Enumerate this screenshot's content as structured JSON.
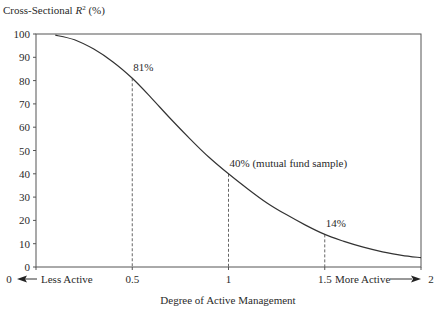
{
  "chart_data": {
    "type": "line",
    "title": "",
    "ylabel": "Cross-Sectional R² (%)",
    "ylabel_parts": {
      "prefix": "Cross-Sectional ",
      "var": "R",
      "sup": "2",
      "suffix": " (%)"
    },
    "xlabel": "Degree of Active Management",
    "xlim": [
      0,
      2
    ],
    "ylim": [
      0,
      100
    ],
    "grid": false,
    "legend": null,
    "yticks": [
      0,
      10,
      20,
      30,
      40,
      50,
      60,
      70,
      80,
      90,
      100
    ],
    "xticks": [
      {
        "value": 0,
        "label": "0"
      },
      {
        "value": 0.5,
        "label": "0.5"
      },
      {
        "value": 1,
        "label": "1"
      },
      {
        "value": 1.5,
        "label": "1.5"
      },
      {
        "value": 2,
        "label": "2"
      }
    ],
    "x_annotations": {
      "left": "Less Active",
      "right": "More Active"
    },
    "series": [
      {
        "name": "Cross-Sectional R²",
        "x": [
          0.1,
          0.2,
          0.3,
          0.4,
          0.5,
          0.6,
          0.7,
          0.8,
          0.9,
          1.0,
          1.1,
          1.2,
          1.3,
          1.4,
          1.5,
          1.6,
          1.7,
          1.8,
          1.9,
          2.0
        ],
        "y": [
          99.5,
          97.5,
          93.5,
          88,
          81,
          72.5,
          63.5,
          55,
          47,
          40,
          33.5,
          27.5,
          22.5,
          18,
          14,
          11,
          8.5,
          6.5,
          5,
          4
        ]
      }
    ],
    "annotations": [
      {
        "x": 0.5,
        "y": 81,
        "label": "81%"
      },
      {
        "x": 1.0,
        "y": 40,
        "label": "40% (mutual fund sample)"
      },
      {
        "x": 1.5,
        "y": 14,
        "label": "14%"
      }
    ]
  },
  "colors": {
    "line": "#333333",
    "axis": "#555555",
    "dash": "#666666"
  }
}
